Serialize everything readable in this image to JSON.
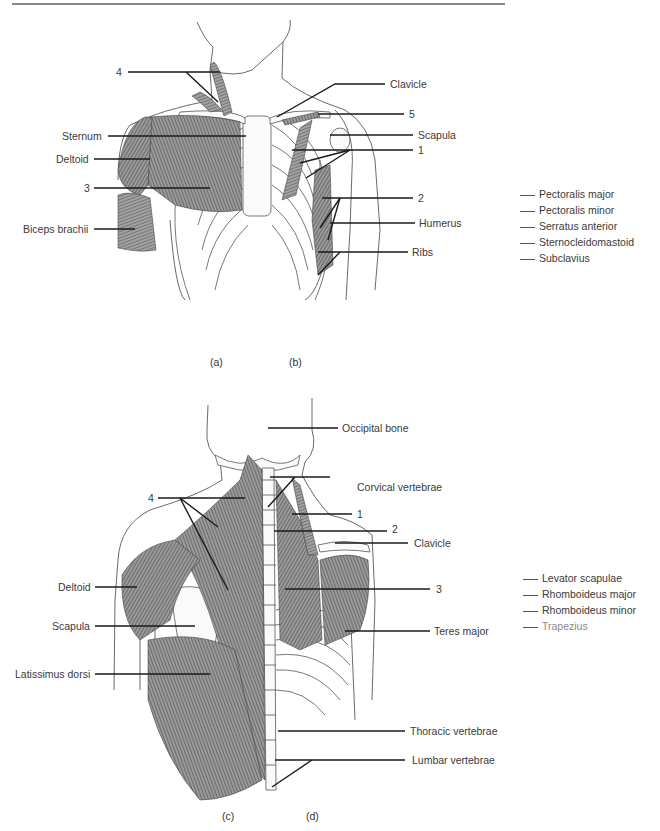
{
  "figure_top": {
    "labels_left": {
      "num4": "4",
      "sternum": "Sternum",
      "deltoid": "Deltoid",
      "num3": "3",
      "biceps": "Biceps brachii"
    },
    "labels_right": {
      "clavicle": "Clavicle",
      "num5": "5",
      "scapula": "Scapula",
      "num1": "1",
      "num2": "2",
      "humerus": "Humerus",
      "ribs": "Ribs"
    },
    "word_bank": [
      "Pectoralis major",
      "Pectoralis minor",
      "Serratus anterior",
      "Sternocleidomastoid",
      "Subclavius"
    ],
    "captions": {
      "a": "(a)",
      "b": "(b)"
    }
  },
  "figure_bottom": {
    "labels_left": {
      "num4": "4",
      "deltoid": "Deltoid",
      "scapula": "Scapula",
      "latissimus": "Latissimus dorsi"
    },
    "labels_right": {
      "occipital": "Occipital bone",
      "cervical": "Corvical vertebrae",
      "num1": "1",
      "num2": "2",
      "clavicle": "Clavicle",
      "num3": "3",
      "teres": "Teres major",
      "thoracic": "Thoracic vertebrae",
      "lumbar": "Lumbar vertebrae"
    },
    "word_bank": [
      "Levator scapulae",
      "Rhomboideus major",
      "Rhomboideus minor",
      "Trapezius"
    ],
    "captions": {
      "c": "(c)",
      "d": "(d)"
    }
  }
}
